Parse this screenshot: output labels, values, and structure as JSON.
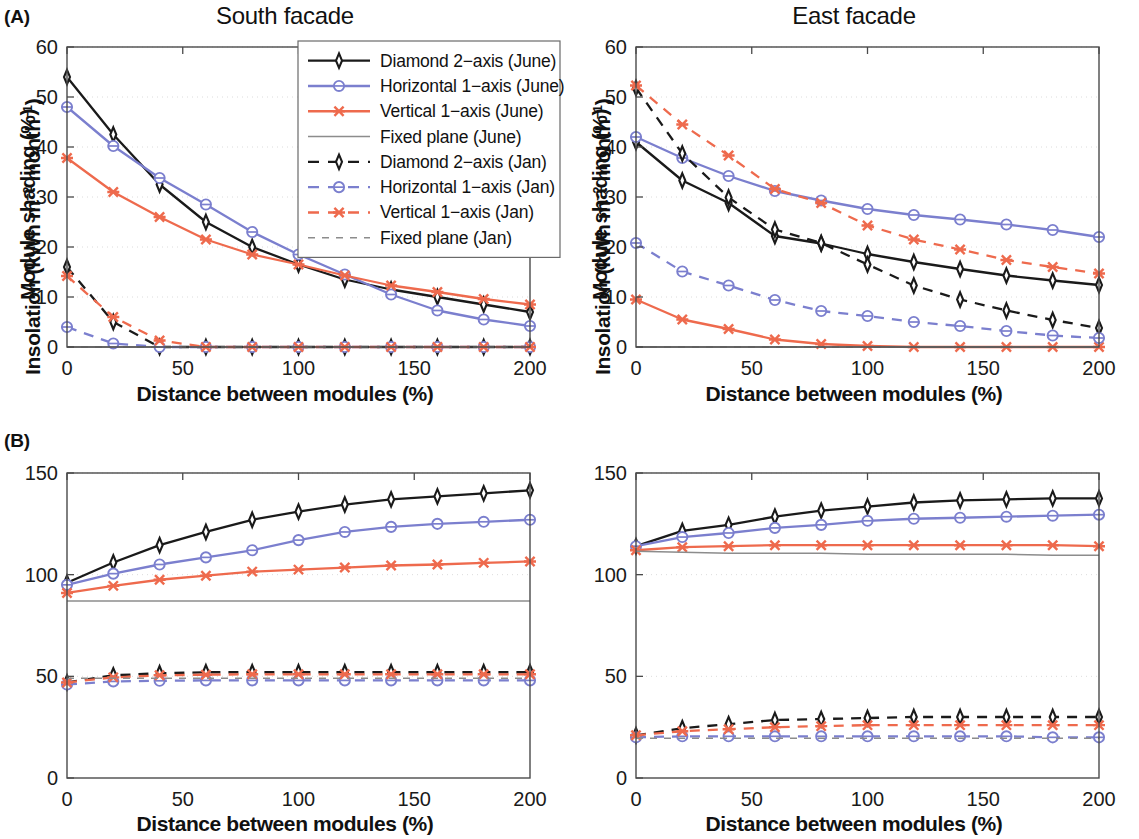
{
  "figure": {
    "panels": [
      {
        "tag": "(A)",
        "title": "South facade"
      },
      {
        "tag": "(B)",
        "title": "East facade"
      }
    ]
  },
  "labels": {
    "panel_a_tag": "(A)",
    "panel_b_tag": "(B)",
    "title_south": "South facade",
    "title_east": "East facade",
    "xlabel": "Distance between modules (%)",
    "ylabel_shading": "Module shading (%)",
    "ylabel_insolation_pre": "Insolation (kWh m",
    "ylabel_insolation_sup1": "−2",
    "ylabel_insolation_mid": " month",
    "ylabel_insolation_sup2": "−1",
    "ylabel_insolation_post": ")"
  },
  "colors": {
    "black": "#1a1a1a",
    "blue": "#7b7fce",
    "orange": "#ee6a4d",
    "grey": "#8c8c8c",
    "frame": "#4a4a4a",
    "grid": "#d8d8d8",
    "background": "#ffffff"
  },
  "legend": {
    "position": "top-right of panel A",
    "entries": [
      {
        "label": "Diamond 2−axis (June)",
        "color": "#1a1a1a",
        "marker": "diamond",
        "dash": "solid"
      },
      {
        "label": "Horizontal 1−axis (June)",
        "color": "#7b7fce",
        "marker": "circle",
        "dash": "solid"
      },
      {
        "label": "Vertical 1−axis (June)",
        "color": "#ee6a4d",
        "marker": "cross",
        "dash": "solid"
      },
      {
        "label": "Fixed plane (June)",
        "color": "#8c8c8c",
        "marker": "none",
        "dash": "solid"
      },
      {
        "label": "Diamond 2−axis (Jan)",
        "color": "#1a1a1a",
        "marker": "diamond",
        "dash": "dashed"
      },
      {
        "label": "Horizontal 1−axis (Jan)",
        "color": "#7b7fce",
        "marker": "circle",
        "dash": "dashed"
      },
      {
        "label": "Vertical 1−axis (Jan)",
        "color": "#ee6a4d",
        "marker": "cross",
        "dash": "dashed"
      },
      {
        "label": "Fixed plane (Jan)",
        "color": "#8c8c8c",
        "marker": "none",
        "dash": "dashed"
      }
    ]
  },
  "chart_data": [
    {
      "id": "A-south-shading",
      "type": "line",
      "title": "South facade",
      "panel_tag": "(A)",
      "xlabel": "Distance between modules (%)",
      "ylabel": "Module shading (%)",
      "x": [
        0,
        20,
        40,
        60,
        80,
        100,
        120,
        140,
        160,
        180,
        200
      ],
      "xlim": [
        0,
        200
      ],
      "ylim": [
        0,
        60
      ],
      "xticks": [
        0,
        50,
        100,
        150,
        200
      ],
      "yticks": [
        0,
        10,
        20,
        30,
        40,
        50,
        60
      ],
      "grid": true,
      "series": [
        {
          "name": "Diamond 2−axis (June)",
          "color": "#1a1a1a",
          "marker": "diamond",
          "dash": "solid",
          "values": [
            54.0,
            42.5,
            32.5,
            25.0,
            20.0,
            16.5,
            13.5,
            11.5,
            10.0,
            8.5,
            7.0
          ]
        },
        {
          "name": "Horizontal 1−axis (June)",
          "color": "#7b7fce",
          "marker": "circle",
          "dash": "solid",
          "values": [
            48.0,
            40.2,
            33.8,
            28.5,
            23.0,
            18.5,
            14.5,
            10.5,
            7.3,
            5.5,
            4.2
          ]
        },
        {
          "name": "Vertical 1−axis (June)",
          "color": "#ee6a4d",
          "marker": "cross",
          "dash": "solid",
          "values": [
            37.8,
            31.0,
            26.0,
            21.5,
            18.5,
            16.5,
            14.3,
            12.3,
            11.0,
            9.6,
            8.5
          ]
        },
        {
          "name": "Fixed plane (June)",
          "color": "#8c8c8c",
          "marker": "none",
          "dash": "solid",
          "values": [
            0,
            0,
            0,
            0,
            0,
            0,
            0,
            0,
            0,
            0,
            0
          ]
        },
        {
          "name": "Diamond 2−axis (Jan)",
          "color": "#1a1a1a",
          "marker": "diamond",
          "dash": "dashed",
          "values": [
            16.0,
            5.0,
            0.0,
            0.0,
            0.0,
            0.0,
            0.0,
            0.0,
            0.0,
            0.0,
            0.0
          ]
        },
        {
          "name": "Horizontal 1−axis (Jan)",
          "color": "#7b7fce",
          "marker": "circle",
          "dash": "dashed",
          "values": [
            4.0,
            0.7,
            0.0,
            0.0,
            0.0,
            0.0,
            0.0,
            0.0,
            0.0,
            0.0,
            0.0
          ]
        },
        {
          "name": "Vertical 1−axis (Jan)",
          "color": "#ee6a4d",
          "marker": "cross",
          "dash": "dashed",
          "values": [
            14.2,
            6.0,
            1.3,
            0.0,
            0.0,
            0.0,
            0.0,
            0.0,
            0.0,
            0.0,
            0.0
          ]
        },
        {
          "name": "Fixed plane (Jan)",
          "color": "#8c8c8c",
          "marker": "none",
          "dash": "dashed",
          "values": [
            0,
            0,
            0,
            0,
            0,
            0,
            0,
            0,
            0,
            0,
            0
          ]
        }
      ]
    },
    {
      "id": "A-east-shading",
      "type": "line",
      "title": "East facade",
      "panel_tag": "(A)",
      "xlabel": "Distance between modules (%)",
      "ylabel": "Module shading (%)",
      "x": [
        0,
        20,
        40,
        60,
        80,
        100,
        120,
        140,
        160,
        180,
        200
      ],
      "xlim": [
        0,
        200
      ],
      "ylim": [
        0,
        60
      ],
      "xticks": [
        0,
        50,
        100,
        150,
        200
      ],
      "yticks": [
        0,
        10,
        20,
        30,
        40,
        50,
        60
      ],
      "grid": true,
      "series": [
        {
          "name": "Diamond 2−axis (June)",
          "color": "#1a1a1a",
          "marker": "diamond",
          "dash": "solid",
          "values": [
            41.0,
            33.3,
            28.8,
            22.2,
            20.7,
            18.6,
            17.0,
            15.6,
            14.3,
            13.3,
            12.4
          ]
        },
        {
          "name": "Horizontal 1−axis (June)",
          "color": "#7b7fce",
          "marker": "circle",
          "dash": "solid",
          "values": [
            42.0,
            37.8,
            34.2,
            31.2,
            29.3,
            27.6,
            26.4,
            25.5,
            24.5,
            23.4,
            22.0
          ]
        },
        {
          "name": "Vertical 1−axis (June)",
          "color": "#ee6a4d",
          "marker": "cross",
          "dash": "solid",
          "values": [
            9.5,
            5.5,
            3.6,
            1.5,
            0.6,
            0.2,
            0.0,
            0.0,
            0.0,
            0.0,
            0.0
          ]
        },
        {
          "name": "Fixed plane (June)",
          "color": "#8c8c8c",
          "marker": "none",
          "dash": "solid",
          "values": [
            0,
            0,
            0,
            0,
            0,
            0,
            0,
            0,
            0,
            0,
            0
          ]
        },
        {
          "name": "Diamond 2−axis (Jan)",
          "color": "#1a1a1a",
          "marker": "diamond",
          "dash": "dashed",
          "values": [
            51.8,
            38.7,
            29.9,
            23.5,
            20.8,
            16.5,
            12.3,
            9.5,
            7.3,
            5.4,
            3.8
          ]
        },
        {
          "name": "Horizontal 1−axis (Jan)",
          "color": "#7b7fce",
          "marker": "circle",
          "dash": "dashed",
          "values": [
            20.8,
            15.1,
            12.3,
            9.4,
            7.2,
            6.2,
            5.0,
            4.2,
            3.2,
            2.3,
            1.8
          ]
        },
        {
          "name": "Vertical 1−axis (Jan)",
          "color": "#ee6a4d",
          "marker": "cross",
          "dash": "dashed",
          "values": [
            52.3,
            44.5,
            38.3,
            31.6,
            28.8,
            24.3,
            21.5,
            19.5,
            17.4,
            16.0,
            14.7
          ]
        },
        {
          "name": "Fixed plane (Jan)",
          "color": "#8c8c8c",
          "marker": "none",
          "dash": "dashed",
          "values": [
            0,
            0,
            0,
            0,
            0,
            0,
            0,
            0,
            0,
            0,
            0
          ]
        }
      ]
    },
    {
      "id": "B-south-insolation",
      "type": "line",
      "title": "South facade",
      "panel_tag": "(B)",
      "xlabel": "Distance between modules (%)",
      "ylabel": "Insolation (kWh m−2 month−1)",
      "x": [
        0,
        20,
        40,
        60,
        80,
        100,
        120,
        140,
        160,
        180,
        200
      ],
      "xlim": [
        0,
        200
      ],
      "ylim": [
        0,
        150
      ],
      "xticks": [
        0,
        50,
        100,
        150,
        200
      ],
      "yticks": [
        0,
        50,
        100,
        150
      ],
      "grid": true,
      "series": [
        {
          "name": "Diamond 2−axis (June)",
          "color": "#1a1a1a",
          "marker": "diamond",
          "dash": "solid",
          "values": [
            96.0,
            106.0,
            114.5,
            121.0,
            127.0,
            131.0,
            134.5,
            137.0,
            138.5,
            140.0,
            141.5
          ]
        },
        {
          "name": "Horizontal 1−axis (June)",
          "color": "#7b7fce",
          "marker": "circle",
          "dash": "solid",
          "values": [
            95.0,
            100.5,
            105.0,
            108.5,
            112.0,
            117.0,
            121.0,
            123.5,
            125.0,
            126.0,
            127.0
          ]
        },
        {
          "name": "Vertical 1−axis (June)",
          "color": "#ee6a4d",
          "marker": "cross",
          "dash": "solid",
          "values": [
            91.0,
            94.5,
            97.5,
            99.5,
            101.5,
            102.5,
            103.5,
            104.5,
            105.0,
            105.8,
            106.5
          ]
        },
        {
          "name": "Fixed plane (June)",
          "color": "#8c8c8c",
          "marker": "none",
          "dash": "solid",
          "values": [
            87.0,
            87.0,
            87.0,
            87.0,
            87.0,
            87.0,
            87.0,
            87.0,
            87.0,
            87.0,
            87.0
          ]
        },
        {
          "name": "Diamond 2−axis (Jan)",
          "color": "#1a1a1a",
          "marker": "diamond",
          "dash": "dashed",
          "values": [
            47.0,
            50.5,
            51.5,
            52.0,
            52.0,
            52.0,
            52.0,
            52.0,
            52.0,
            52.0,
            52.0
          ]
        },
        {
          "name": "Horizontal 1−axis (Jan)",
          "color": "#7b7fce",
          "marker": "circle",
          "dash": "dashed",
          "values": [
            46.0,
            47.5,
            47.8,
            48.0,
            48.0,
            48.0,
            48.0,
            48.0,
            48.0,
            48.0,
            48.0
          ]
        },
        {
          "name": "Vertical 1−axis (Jan)",
          "color": "#ee6a4d",
          "marker": "cross",
          "dash": "dashed",
          "values": [
            47.0,
            49.5,
            50.5,
            50.8,
            51.0,
            51.0,
            51.0,
            51.0,
            51.0,
            51.0,
            51.0
          ]
        },
        {
          "name": "Fixed plane (Jan)",
          "color": "#8c8c8c",
          "marker": "none",
          "dash": "dashed",
          "values": [
            49.0,
            49.0,
            49.0,
            49.0,
            49.0,
            49.0,
            49.0,
            49.0,
            49.0,
            49.0,
            49.0
          ]
        }
      ]
    },
    {
      "id": "B-east-insolation",
      "type": "line",
      "title": "East facade",
      "panel_tag": "(B)",
      "xlabel": "Distance between modules (%)",
      "ylabel": "Insolation (kWh m−2 month−1)",
      "x": [
        0,
        20,
        40,
        60,
        80,
        100,
        120,
        140,
        160,
        180,
        200
      ],
      "xlim": [
        0,
        200
      ],
      "ylim": [
        0,
        150
      ],
      "xticks": [
        0,
        50,
        100,
        150,
        200
      ],
      "yticks": [
        0,
        50,
        100,
        150
      ],
      "grid": true,
      "series": [
        {
          "name": "Diamond 2−axis (June)",
          "color": "#1a1a1a",
          "marker": "diamond",
          "dash": "solid",
          "values": [
            114.0,
            121.5,
            124.5,
            128.5,
            131.5,
            133.5,
            135.5,
            136.5,
            137.0,
            137.5,
            137.5
          ]
        },
        {
          "name": "Horizontal 1−axis (June)",
          "color": "#7b7fce",
          "marker": "circle",
          "dash": "solid",
          "values": [
            114.0,
            118.5,
            120.5,
            123.0,
            124.5,
            126.5,
            127.5,
            128.0,
            128.5,
            129.0,
            129.5
          ]
        },
        {
          "name": "Vertical 1−axis (June)",
          "color": "#ee6a4d",
          "marker": "cross",
          "dash": "solid",
          "values": [
            112.0,
            113.5,
            114.0,
            114.5,
            114.5,
            114.5,
            114.5,
            114.5,
            114.5,
            114.5,
            114.0
          ]
        },
        {
          "name": "Fixed plane (June)",
          "color": "#8c8c8c",
          "marker": "none",
          "dash": "solid",
          "values": [
            111.5,
            111.0,
            110.5,
            110.5,
            110.5,
            110.0,
            110.0,
            110.0,
            110.0,
            109.5,
            109.5
          ]
        },
        {
          "name": "Diamond 2−axis (Jan)",
          "color": "#1a1a1a",
          "marker": "diamond",
          "dash": "dashed",
          "values": [
            21.0,
            24.5,
            26.5,
            28.5,
            29.0,
            29.5,
            30.0,
            30.0,
            30.0,
            30.0,
            30.0
          ]
        },
        {
          "name": "Horizontal 1−axis (Jan)",
          "color": "#7b7fce",
          "marker": "circle",
          "dash": "dashed",
          "values": [
            20.0,
            20.5,
            20.5,
            20.5,
            20.5,
            20.5,
            20.5,
            20.5,
            20.5,
            20.0,
            20.0
          ]
        },
        {
          "name": "Vertical 1−axis (Jan)",
          "color": "#ee6a4d",
          "marker": "cross",
          "dash": "dashed",
          "values": [
            21.0,
            23.0,
            24.0,
            25.0,
            25.5,
            26.0,
            26.0,
            26.0,
            26.0,
            26.0,
            26.0
          ]
        },
        {
          "name": "Fixed plane (Jan)",
          "color": "#8c8c8c",
          "marker": "none",
          "dash": "dashed",
          "values": [
            19.5,
            19.5,
            19.5,
            19.5,
            19.5,
            19.5,
            19.5,
            19.5,
            19.5,
            19.5,
            19.5
          ]
        }
      ]
    }
  ]
}
